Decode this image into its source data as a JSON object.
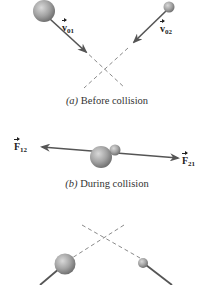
{
  "colors": {
    "ball_light": "#c8c8c8",
    "ball_dark": "#6e6e6e",
    "vector": "#555555",
    "dashed": "#8a8a8a",
    "text": "#222222"
  },
  "panels": [
    {
      "id": "a",
      "caption_letter": "(a)",
      "caption_text": "Before collision",
      "labels": [
        {
          "symbol": "v",
          "subscript": "01"
        },
        {
          "symbol": "v",
          "subscript": "02"
        }
      ]
    },
    {
      "id": "b",
      "caption_letter": "(b)",
      "caption_text": "During collision",
      "labels": [
        {
          "symbol": "F",
          "subscript": "12"
        },
        {
          "symbol": "F",
          "subscript": "21"
        }
      ]
    },
    {
      "id": "c",
      "caption_letter": "",
      "caption_text": "",
      "labels": []
    }
  ]
}
